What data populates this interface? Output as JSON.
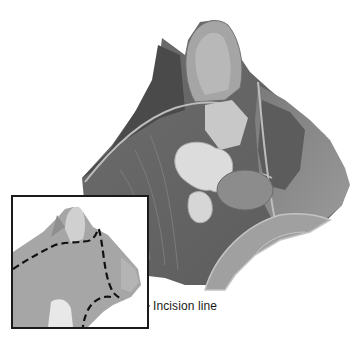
{
  "figure": {
    "main_image": "cat-head-anatomy-dissection-illustration",
    "inset_image": "cat-head-profile-with-dashed-incision-outline",
    "label": "Incision line",
    "colors": {
      "background": "#ffffff",
      "border": "#1a1a1a",
      "text": "#1a1a1a",
      "fur_dark": "#4a4a4a",
      "fur_mid": "#8a8a8a",
      "tissue_light": "#c8c8c8",
      "gland_light": "#dcdcdc"
    }
  }
}
